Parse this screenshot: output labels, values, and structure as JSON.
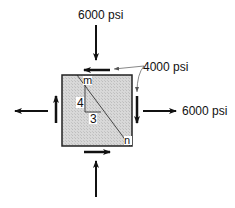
{
  "diagram": {
    "type": "stress-element",
    "labels": {
      "top_normal": "6000 psi",
      "right_normal": "6000 psi",
      "shear": "4000 psi",
      "point_m": "m",
      "point_n": "n",
      "slope_rise": "4",
      "slope_run": "3"
    },
    "colors": {
      "element_fill": "#d4d4d4",
      "stroke": "#111111"
    }
  }
}
